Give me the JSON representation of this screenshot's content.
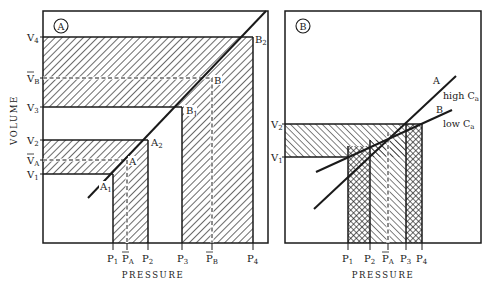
{
  "figure": {
    "panels": [
      {
        "id": "A",
        "badge": "A",
        "frame": {
          "x": 43,
          "y": 11,
          "w": 225,
          "h": 232
        },
        "xlabel": "PRESSURE",
        "ylabel": "VOLUME",
        "y_ticks": [
          {
            "label": "V",
            "sub": "4",
            "bar": false,
            "y": 37
          },
          {
            "label": "V",
            "sub": "B",
            "bar": true,
            "y": 78
          },
          {
            "label": "V",
            "sub": "3",
            "bar": false,
            "y": 107
          },
          {
            "label": "V",
            "sub": "2",
            "bar": false,
            "y": 140
          },
          {
            "label": "V",
            "sub": "A",
            "bar": true,
            "y": 160
          },
          {
            "label": "V",
            "sub": "1",
            "bar": false,
            "y": 174
          }
        ],
        "x_ticks": [
          {
            "label": "P",
            "sub": "1",
            "bar": false,
            "x": 113
          },
          {
            "label": "P",
            "sub": "A",
            "bar": true,
            "x": 127
          },
          {
            "label": "P",
            "sub": "2",
            "bar": false,
            "x": 148
          },
          {
            "label": "P",
            "sub": "3",
            "bar": false,
            "x": 182
          },
          {
            "label": "P",
            "sub": "B",
            "bar": true,
            "x": 212
          },
          {
            "label": "P",
            "sub": "4",
            "bar": false,
            "x": 253
          }
        ],
        "curve": {
          "x1": 88,
          "y1": 198,
          "x2": 266,
          "y2": 11
        },
        "points": [
          {
            "label": "A",
            "sub": "1",
            "x": 100,
            "y": 190
          },
          {
            "label": "A",
            "sub": "",
            "x": 129,
            "y": 166
          },
          {
            "label": "A",
            "sub": "2",
            "x": 151,
            "y": 146
          },
          {
            "label": "B",
            "sub": "1",
            "x": 185,
            "y": 114
          },
          {
            "label": "B",
            "sub": "",
            "x": 214,
            "y": 84
          },
          {
            "label": "B",
            "sub": "2",
            "x": 254,
            "y": 44
          }
        ]
      },
      {
        "id": "B",
        "badge": "B",
        "frame": {
          "x": 285,
          "y": 11,
          "w": 196,
          "h": 232
        },
        "xlabel": "PRESSURE",
        "y_ticks": [
          {
            "label": "V",
            "sub": "2",
            "bar": false,
            "y": 124
          },
          {
            "label": "V",
            "sub": "1",
            "bar": false,
            "y": 157
          }
        ],
        "x_ticks": [
          {
            "label": "P",
            "sub": "1",
            "bar": false,
            "x": 348
          },
          {
            "label": "P",
            "sub": "2",
            "bar": false,
            "x": 370
          },
          {
            "label": "P",
            "sub": "A",
            "bar": true,
            "x": 388
          },
          {
            "label": "P",
            "sub": "3",
            "bar": false,
            "x": 406
          },
          {
            "label": "P",
            "sub": "4",
            "bar": false,
            "x": 422
          }
        ],
        "lines": [
          {
            "name": "A",
            "annotation": "high C",
            "annotation_sub": "a",
            "x1": 314,
            "y1": 209,
            "x2": 456,
            "y2": 76
          },
          {
            "name": "B",
            "annotation": "low C",
            "annotation_sub": "a",
            "x1": 316,
            "y1": 172,
            "x2": 452,
            "y2": 110
          }
        ]
      }
    ]
  }
}
